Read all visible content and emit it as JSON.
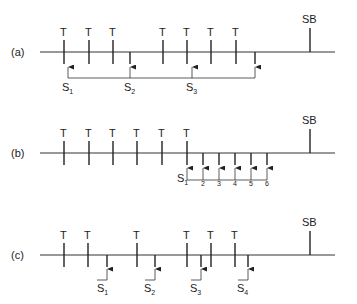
{
  "diagram": {
    "panels": [
      {
        "id": "a",
        "label": "(a)",
        "tick_label": "T",
        "end_label": "SB",
        "samples": [
          {
            "letter": "S",
            "sub": "1"
          },
          {
            "letter": "S",
            "sub": "2"
          },
          {
            "letter": "S",
            "sub": "3"
          }
        ]
      },
      {
        "id": "b",
        "label": "(b)",
        "tick_label": "T",
        "end_label": "SB",
        "samples": [
          {
            "letter": "S",
            "sub": "1"
          },
          {
            "letter": "",
            "sub": "2"
          },
          {
            "letter": "",
            "sub": "3"
          },
          {
            "letter": "",
            "sub": "4"
          },
          {
            "letter": "",
            "sub": "5"
          },
          {
            "letter": "",
            "sub": "6"
          }
        ]
      },
      {
        "id": "c",
        "label": "(c)",
        "tick_label": "T",
        "end_label": "SB",
        "samples": [
          {
            "letter": "S",
            "sub": "1"
          },
          {
            "letter": "S",
            "sub": "2"
          },
          {
            "letter": "S",
            "sub": "3"
          },
          {
            "letter": "S",
            "sub": "4"
          }
        ]
      }
    ],
    "colors": {
      "line": "#333333",
      "text": "#222222"
    }
  }
}
